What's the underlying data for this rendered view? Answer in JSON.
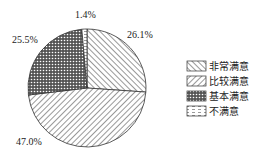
{
  "chart_data": {
    "type": "pie",
    "title": "",
    "categories": [
      "非常满意",
      "比较满意",
      "基本满意",
      "不满意"
    ],
    "values": [
      26.1,
      47.0,
      25.5,
      1.4
    ],
    "labels": [
      "26.1%",
      "47.0%",
      "25.5%",
      "1.4%"
    ],
    "start_angle": "12 o'clock, clockwise",
    "legend_position": "right",
    "patterns": [
      "backslash-hatch",
      "slash-hatch",
      "crosshatch",
      "dashed"
    ]
  },
  "legend": {
    "items": [
      {
        "label": "非常满意"
      },
      {
        "label": "比较满意"
      },
      {
        "label": "基本满意"
      },
      {
        "label": "不满意"
      }
    ]
  }
}
